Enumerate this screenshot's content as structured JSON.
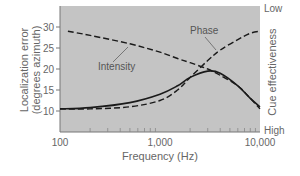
{
  "chart_data": {
    "type": "line",
    "title": "",
    "xlabel": "Frequency (Hz)",
    "ylabel": "Localization error (degrees azimuth)",
    "ylabel_line1": "Localization error",
    "ylabel_line2": "(degrees azimuth)",
    "y2label": "Cue effectiveness",
    "y2_ticks": [
      "Low",
      "High"
    ],
    "x_scale": "log",
    "xlim": [
      100,
      10000
    ],
    "ylim": [
      5,
      35
    ],
    "x_ticks": [
      "100",
      "1,000",
      "10,000"
    ],
    "y_ticks": [
      "10",
      "15",
      "20",
      "25",
      "30"
    ],
    "grid": false,
    "legend": "inline annotations",
    "annotations": [
      {
        "text": "Phase",
        "points_to": "Phase cue curve"
      },
      {
        "text": "Intensity",
        "points_to": "Intensity cue curve"
      }
    ],
    "series": [
      {
        "name": "Localization error",
        "style": "solid",
        "x": [
          100,
          200,
          500,
          1000,
          1500,
          2000,
          3000,
          4000,
          6000,
          8000,
          10000
        ],
        "values": [
          10.5,
          10.8,
          12,
          14,
          16,
          18,
          19.5,
          19,
          16,
          13,
          11
        ]
      },
      {
        "name": "Phase",
        "style": "dashed",
        "x": [
          100,
          200,
          500,
          1000,
          1500,
          2000,
          3000,
          4000,
          6000,
          8000,
          10000
        ],
        "values": [
          10.5,
          10.5,
          11,
          12.5,
          15,
          18,
          22,
          24.5,
          27,
          28.5,
          29
        ]
      },
      {
        "name": "Intensity",
        "style": "dashed",
        "x": [
          120,
          200,
          500,
          1000,
          1500,
          2000,
          3000,
          4000,
          6000,
          8000,
          10000
        ],
        "values": [
          29,
          28,
          26,
          24,
          22.5,
          21.5,
          20,
          18.5,
          16,
          13,
          10.5
        ]
      }
    ]
  },
  "colors": {
    "plot_bg": "#c4c4c4",
    "line": "#1a1a1a",
    "text": "#666666"
  }
}
